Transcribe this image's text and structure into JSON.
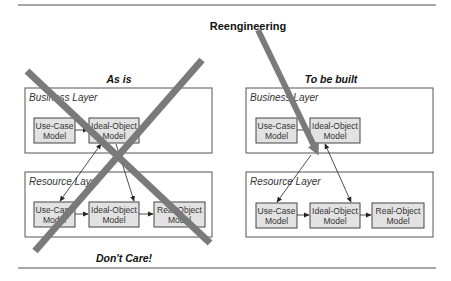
{
  "title": "Reengineering",
  "left_panel": {
    "heading": "As is",
    "footer": "Don't Care!",
    "business_layer": {
      "label": "Business Layer",
      "models": [
        {
          "line1": "Use-Case",
          "line2": "Model"
        },
        {
          "line1": "Ideal-Object",
          "line2": "Model"
        }
      ]
    },
    "resource_layer": {
      "label": "Resource Layer",
      "models": [
        {
          "line1": "Use-Case",
          "line2": "Model"
        },
        {
          "line1": "Ideal-Object",
          "line2": "Model"
        },
        {
          "line1": "Real-Object",
          "line2": "Model"
        }
      ]
    }
  },
  "right_panel": {
    "heading": "To be built",
    "business_layer": {
      "label": "Business Layer",
      "models": [
        {
          "line1": "Use-Case",
          "line2": "Model"
        },
        {
          "line1": "Ideal-Object",
          "line2": "Model"
        }
      ]
    },
    "resource_layer": {
      "label": "Resource Layer",
      "models": [
        {
          "line1": "Use-Case",
          "line2": "Model"
        },
        {
          "line1": "Ideal-Object",
          "line2": "Model"
        },
        {
          "line1": "Real-Object",
          "line2": "Model"
        }
      ]
    }
  },
  "colors": {
    "model_fill": "#e2e2e2",
    "cross_stroke": "#7a7a7a",
    "rule": "#8a8a8a"
  }
}
